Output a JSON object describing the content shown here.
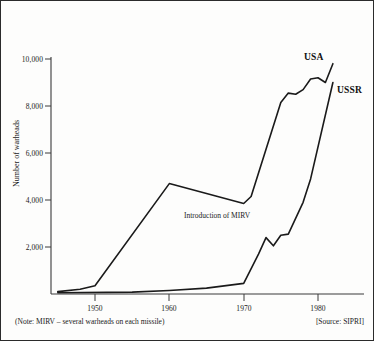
{
  "chart_data": {
    "type": "line",
    "title": "",
    "xlabel": "",
    "ylabel": "Number of warheads",
    "xlim": [
      1945,
      1983
    ],
    "ylim": [
      0,
      10000
    ],
    "grid": false,
    "legend_position": "inline-right-end",
    "x_ticks": [
      "1950",
      "1960",
      "1970",
      "1980"
    ],
    "x_tick_values": [
      1950,
      1960,
      1970,
      1980
    ],
    "y_ticks": [
      "2,000",
      "4,000",
      "6,000",
      "8,000",
      "10,000"
    ],
    "y_tick_values": [
      2000,
      4000,
      6000,
      8000,
      10000
    ],
    "annotations": [
      {
        "text": "Introduction of MIRV",
        "x": 1966,
        "y": 3000
      }
    ],
    "series": [
      {
        "name": "USA",
        "x": [
          1945,
          1948,
          1950,
          1960,
          1970,
          1971,
          1975,
          1976,
          1977,
          1978,
          1979,
          1980,
          1981,
          1982
        ],
        "values": [
          100,
          200,
          350,
          4700,
          3850,
          4150,
          8150,
          8550,
          8500,
          8700,
          9150,
          9200,
          9000,
          9800
        ]
      },
      {
        "name": "USSR",
        "x": [
          1945,
          1955,
          1960,
          1965,
          1970,
          1972,
          1973,
          1974,
          1975,
          1976,
          1978,
          1979,
          1982
        ],
        "values": [
          50,
          80,
          150,
          250,
          450,
          1700,
          2400,
          2050,
          2500,
          2550,
          3900,
          4900,
          9000
        ]
      }
    ]
  },
  "labels": {
    "usa": "USA",
    "ussr": "USSR",
    "y_axis_title": "Number of warheads",
    "annotation_mirv": "Introduction of MIRV"
  },
  "footer": {
    "note": "(Note: MIRV – several warheads on each missile)",
    "source": "[Source: SIPRI]"
  },
  "colors": {
    "line": "#1a1a1a",
    "axis": "#3a3a3a",
    "border": "#2b2b2b",
    "background": "#fdfdfc"
  }
}
